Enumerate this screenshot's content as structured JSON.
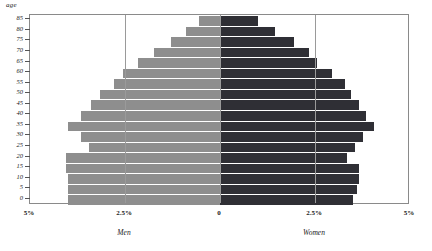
{
  "axes": {
    "y_axis_title": "age",
    "x_tick_labels": [
      "5%",
      "2.5%",
      "0",
      "2.5%",
      "5%"
    ],
    "y_tick_labels": [
      "85",
      "80",
      "75",
      "70",
      "65",
      "60",
      "55",
      "50",
      "45",
      "40",
      "35",
      "30",
      "25",
      "20",
      "15",
      "10",
      "5",
      "0"
    ]
  },
  "series_labels": {
    "left": "Men",
    "right": "Women"
  },
  "colors": {
    "men": "#8e8e8e",
    "women": "#2f2f35",
    "frame": "#8a8a8a",
    "gridline": "#9a9a9a",
    "background": "#ffffff"
  },
  "chart_data": {
    "type": "bar",
    "title": "",
    "subtitle": "",
    "orientation": "horizontal-pyramid",
    "xlabel": "",
    "ylabel": "age",
    "xlim": [
      -5,
      5
    ],
    "ylim": [
      0,
      85
    ],
    "grid": true,
    "gridlines_at": [
      -2.5,
      0,
      2.5
    ],
    "legend_position": "below-axis",
    "categories": [
      "85",
      "80",
      "75",
      "70",
      "65",
      "60",
      "55",
      "50",
      "45",
      "40",
      "35",
      "30",
      "25",
      "20",
      "15",
      "10",
      "5",
      "0"
    ],
    "series": [
      {
        "name": "Men",
        "side": "left",
        "color": "#8e8e8e",
        "values": [
          0.55,
          0.9,
          1.3,
          1.75,
          2.15,
          2.55,
          2.8,
          3.15,
          3.4,
          3.65,
          4.0,
          3.65,
          3.45,
          4.05,
          4.05,
          4.0,
          4.0,
          4.0
        ]
      },
      {
        "name": "Women",
        "side": "right",
        "color": "#2f2f35",
        "values": [
          1.0,
          1.45,
          1.95,
          2.35,
          2.55,
          2.95,
          3.3,
          3.45,
          3.65,
          3.85,
          4.05,
          3.75,
          3.55,
          3.35,
          3.65,
          3.65,
          3.6,
          3.5
        ]
      }
    ]
  }
}
